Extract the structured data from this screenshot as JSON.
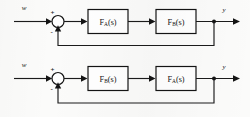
{
  "figure": {
    "type": "control-block-diagram",
    "background_color": "#fbfbfa",
    "line_color": "#141414",
    "diagrams": [
      {
        "id": "top",
        "input_label": "w",
        "output_label": "y",
        "sum_positive_sign": "+",
        "sum_negative_sign": "-",
        "blocks": [
          {
            "base": "F",
            "subscript": "A",
            "arg": "(s)",
            "full": "FA(s)"
          },
          {
            "base": "F",
            "subscript": "B",
            "arg": "(s)",
            "full": "FB(s)"
          }
        ],
        "feedback": "unity"
      },
      {
        "id": "bottom",
        "input_label": "w",
        "output_label": "y",
        "sum_positive_sign": "+",
        "sum_negative_sign": "-",
        "blocks": [
          {
            "base": "F",
            "subscript": "B",
            "arg": "(s)",
            "full": "FB(s)"
          },
          {
            "base": "F",
            "subscript": "A",
            "arg": "(s)",
            "full": "FA(s)"
          }
        ],
        "feedback": "unity"
      }
    ]
  }
}
